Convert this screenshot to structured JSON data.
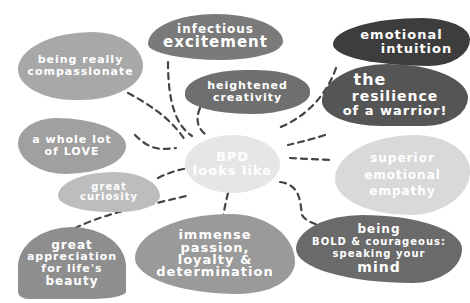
{
  "diagram": {
    "center": {
      "lines": [
        "BPD",
        "looks like"
      ],
      "color": "#e6e6e6"
    },
    "nodes": [
      {
        "id": "compassionate",
        "lines": [
          "being really",
          "compassionate"
        ],
        "color": "#a8a8a8"
      },
      {
        "id": "excitement",
        "lines": [
          "infectious",
          "excitement"
        ],
        "color": "#7a7a7a"
      },
      {
        "id": "creativity",
        "lines": [
          "heightened",
          "creativity"
        ],
        "color": "#6f6f6f"
      },
      {
        "id": "intuition",
        "lines": [
          "emotional",
          "intuition"
        ],
        "color": "#3d3d3d"
      },
      {
        "id": "resilience",
        "lines": [
          "the",
          "resilience",
          "of a warrior!"
        ],
        "color": "#555555"
      },
      {
        "id": "love",
        "lines": [
          "a whole lot",
          "of LOVE"
        ],
        "color": "#a0a0a0"
      },
      {
        "id": "curiosity",
        "lines": [
          "great",
          "curiosity"
        ],
        "color": "#bdbdbd"
      },
      {
        "id": "empathy",
        "lines": [
          "superior",
          "emotional",
          "empathy"
        ],
        "color": "#d9d9d9"
      },
      {
        "id": "appreciation",
        "lines": [
          "great",
          "appreciation",
          "for life's",
          "beauty"
        ],
        "color": "#8e8e8e"
      },
      {
        "id": "passion",
        "lines": [
          "immense",
          "passion,",
          "loyalty &",
          "determination"
        ],
        "color": "#9a9a9a"
      },
      {
        "id": "bold",
        "lines": [
          "being",
          "BOLD & courageous:",
          "speaking your",
          "mind"
        ],
        "color": "#6a6a6a"
      }
    ],
    "connector_color": "#444444"
  }
}
